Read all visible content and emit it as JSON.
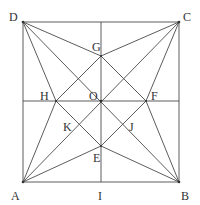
{
  "diagram": {
    "type": "geometry",
    "colors": {
      "line": "#4a4a4a",
      "label": "#333333",
      "background": "#ffffff"
    },
    "points": {
      "A": {
        "label": "A",
        "x": 23,
        "y": 182,
        "lx": 11,
        "ly": 200
      },
      "B": {
        "label": "B",
        "x": 179,
        "y": 182,
        "lx": 181,
        "ly": 200
      },
      "C": {
        "label": "C",
        "x": 179,
        "y": 22,
        "lx": 183,
        "ly": 21
      },
      "D": {
        "label": "D",
        "x": 23,
        "y": 22,
        "lx": 9,
        "ly": 21
      },
      "G": {
        "label": "G",
        "x": 101,
        "y": 56,
        "lx": 92,
        "ly": 51
      },
      "H": {
        "label": "H",
        "x": 56,
        "y": 101,
        "lx": 40,
        "ly": 100
      },
      "F": {
        "label": "F",
        "x": 146,
        "y": 101,
        "lx": 151,
        "ly": 100
      },
      "E": {
        "label": "E",
        "x": 101,
        "y": 146,
        "lx": 93,
        "ly": 162
      },
      "O": {
        "label": "O",
        "x": 101,
        "y": 101,
        "lx": 89,
        "ly": 100
      },
      "K": {
        "label": "K",
        "x": 79,
        "y": 124,
        "lx": 63,
        "ly": 131
      },
      "J": {
        "label": "J",
        "x": 124,
        "y": 124,
        "lx": 129,
        "ly": 131
      },
      "I": {
        "label": "I",
        "x": 101,
        "y": 182,
        "lx": 98,
        "ly": 200
      }
    },
    "segments": [
      [
        "A",
        "B"
      ],
      [
        "B",
        "C"
      ],
      [
        "C",
        "D"
      ],
      [
        "D",
        "A"
      ],
      [
        "A",
        "C"
      ],
      [
        "B",
        "D"
      ],
      [
        "I",
        "TOP"
      ],
      [
        "LEFT",
        "RIGHT"
      ],
      [
        "G",
        "F"
      ],
      [
        "F",
        "E"
      ],
      [
        "E",
        "H"
      ],
      [
        "H",
        "G"
      ],
      [
        "D",
        "G"
      ],
      [
        "D",
        "H"
      ],
      [
        "C",
        "G"
      ],
      [
        "C",
        "F"
      ],
      [
        "B",
        "F"
      ],
      [
        "B",
        "E"
      ],
      [
        "A",
        "H"
      ],
      [
        "A",
        "E"
      ]
    ]
  }
}
